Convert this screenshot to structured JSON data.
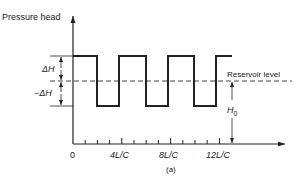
{
  "diagram": {
    "title": "Pressure head",
    "y_axis_label": "Pressure head",
    "x_ticks": [
      "0",
      "4L/C",
      "8L/C",
      "12L/C"
    ],
    "level_labels": {
      "plus_delta": "ΔH",
      "minus_delta": "−ΔH",
      "reservoir": "Reservoir level",
      "h0_main": "H",
      "h0_sub": "0"
    },
    "caption": "(a)",
    "colors": {
      "line": "#222222",
      "dash": "#444444",
      "background": "#ffffff"
    }
  }
}
